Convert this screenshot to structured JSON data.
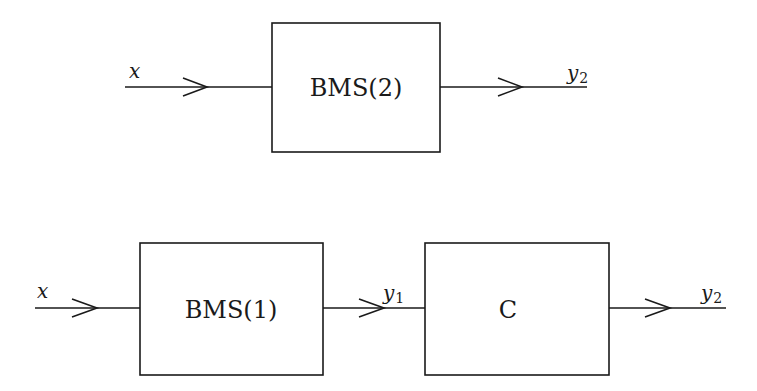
{
  "diagram": {
    "top": {
      "input_label": "x",
      "block_label": "BMS(2)",
      "output_label": "y",
      "output_sub": "2"
    },
    "bottom": {
      "input_label": "x",
      "block1_label": "BMS(1)",
      "mid_label": "y",
      "mid_sub": "1",
      "block2_label": "C",
      "output_label": "y",
      "output_sub": "2"
    }
  }
}
